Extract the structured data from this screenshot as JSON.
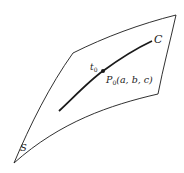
{
  "diagram": {
    "surface_label": "S",
    "curve_label": "C",
    "parameter_label": "t",
    "parameter_subscript": "0",
    "point_label": {
      "name": "P",
      "subscript": "0",
      "coords": "(a, b, c)"
    },
    "colors": {
      "stroke": "#1a1a1a",
      "background": "#ffffff"
    }
  }
}
